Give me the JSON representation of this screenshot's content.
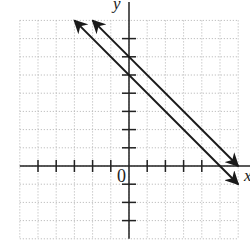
{
  "chart_data": {
    "type": "line",
    "title": "",
    "xlabel": "x",
    "ylabel": "y",
    "origin_label": "0",
    "xlim": [
      -6,
      6
    ],
    "ylim": [
      -4,
      8
    ],
    "grid": true,
    "grid_style": "dotted",
    "x_ticks": [
      -5,
      -4,
      -3,
      -2,
      -1,
      1,
      2,
      3,
      4
    ],
    "y_ticks": [
      -3,
      -2,
      -1,
      1,
      2,
      3,
      4,
      5,
      6,
      7
    ],
    "series": [
      {
        "name": "line-upper",
        "equation": "y = -x + 6",
        "slope": -1,
        "intercept": 6,
        "x": [
          -2,
          6
        ],
        "y": [
          8,
          0
        ],
        "arrows": "both"
      },
      {
        "name": "line-lower",
        "equation": "y = -x + 5",
        "slope": -1,
        "intercept": 5,
        "x": [
          -3,
          6
        ],
        "y": [
          8,
          -1
        ],
        "arrows": "both"
      }
    ]
  },
  "layout": {
    "origin_px": [
      129,
      166
    ],
    "unit_px": 18.2,
    "line_color": "#1a1a1a",
    "grid_color": "#b0b0b0",
    "axis_color": "#222222"
  }
}
